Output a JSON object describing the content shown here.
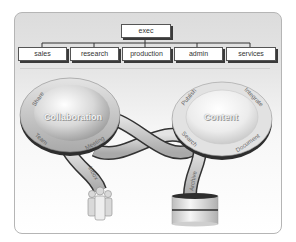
{
  "org_chart": {
    "root": "exec",
    "departments": [
      "sales",
      "research",
      "production",
      "admin",
      "services"
    ]
  },
  "hubs": [
    {
      "title": "Collaboration",
      "ring_labels": [
        "Share",
        "Team",
        "Meeting"
      ],
      "stem_label": "Inbox",
      "endpoint": "people-icon"
    },
    {
      "title": "Content",
      "ring_labels": [
        "Publish",
        "Integrate",
        "Search",
        "Document"
      ],
      "stem_label": "Archive",
      "endpoint": "database-icon"
    }
  ],
  "colors": {
    "panel_border": "#b5b5b5",
    "box_border": "#555555",
    "ring": "#bdbdbd",
    "outline": "#333333"
  }
}
